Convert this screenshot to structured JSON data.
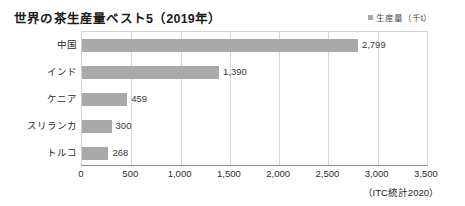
{
  "chart_data": {
    "type": "bar",
    "orientation": "horizontal",
    "title": "世界の茶生産量ベスト5（2019年）",
    "categories": [
      "中国",
      "インド",
      "ケニア",
      "スリランカ",
      "トルコ"
    ],
    "values": [
      2799,
      1390,
      459,
      300,
      268
    ],
    "value_labels": [
      "2,799",
      "1,390",
      "459",
      "300",
      "268"
    ],
    "series": [
      {
        "name": "生産量（千t）",
        "values": [
          2799,
          1390,
          459,
          300,
          268
        ],
        "color": "#a9a9a9"
      }
    ],
    "legend": {
      "position": "top-right",
      "entries": [
        "生産量（千t）"
      ],
      "marker_color": "#a9a9a9"
    },
    "xlabel": "",
    "ylabel": "",
    "xlim": [
      0,
      3500
    ],
    "xticks": [
      0,
      500,
      1000,
      1500,
      2000,
      2500,
      3000,
      3500
    ],
    "xtick_labels": [
      "0",
      "500",
      "1,000",
      "1,500",
      "2,000",
      "2,500",
      "3,000",
      "3,500"
    ],
    "grid": "vertical",
    "source": "（ITC統計2020）",
    "unit": "千t"
  },
  "colors": {
    "bar": "#a9a9a9",
    "gridline": "#d6d6d6",
    "axis": "#8c8c8c",
    "text": "#2b2b2b",
    "background": "#ffffff"
  }
}
